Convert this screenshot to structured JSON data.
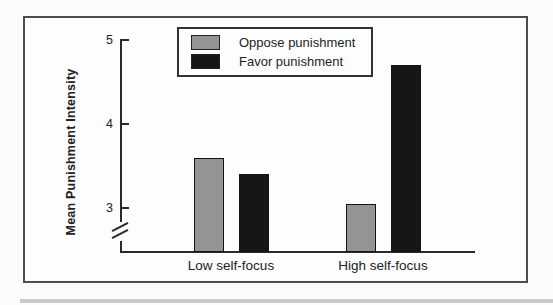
{
  "figure": {
    "ylabel": "Mean Punishment Intensity"
  },
  "chart_data": {
    "type": "bar",
    "categories": [
      "Low self-focus",
      "High self-focus"
    ],
    "series": [
      {
        "name": "Oppose punishment",
        "color": "#949494",
        "values": [
          3.6,
          3.05
        ]
      },
      {
        "name": "Favor punishment",
        "color": "#161616",
        "values": [
          3.4,
          4.7
        ]
      }
    ],
    "title": "",
    "xlabel": "",
    "ylabel": "Mean Punishment Intensity",
    "yticks": [
      5,
      4,
      3
    ],
    "ylim_shown": [
      3,
      5
    ],
    "axis_break_below": 3,
    "grid": false,
    "legend_position": "top-center"
  }
}
